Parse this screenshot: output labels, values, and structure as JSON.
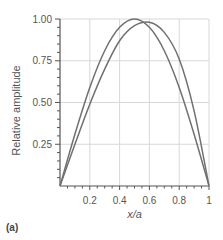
{
  "chart_data": {
    "type": "line",
    "title": "",
    "xlabel": "x/a",
    "ylabel": "Relative amplitude",
    "xlim": [
      0,
      1
    ],
    "ylim": [
      0,
      1.0
    ],
    "grid": true,
    "x_ticks": [
      "0.2",
      "0.4",
      "0.6",
      "0.8",
      "1"
    ],
    "y_ticks": [
      "0.25",
      "0.50",
      "0.75",
      "1.00"
    ],
    "x": [
      0,
      0.1,
      0.2,
      0.3,
      0.4,
      0.5,
      0.6,
      0.7,
      0.8,
      0.9,
      1.0
    ],
    "series": [
      {
        "name": "curve-1",
        "values": [
          0,
          0.31,
          0.59,
          0.81,
          0.95,
          1.0,
          0.95,
          0.81,
          0.59,
          0.31,
          0
        ]
      },
      {
        "name": "curve-2",
        "values": [
          0,
          0.25,
          0.49,
          0.7,
          0.87,
          0.96,
          0.98,
          0.92,
          0.76,
          0.45,
          0
        ]
      }
    ],
    "legend": null,
    "panel_label": "(a)"
  },
  "colors": {
    "curve": "#707070",
    "grid": "#d8d8d8",
    "axis": "#555555"
  }
}
